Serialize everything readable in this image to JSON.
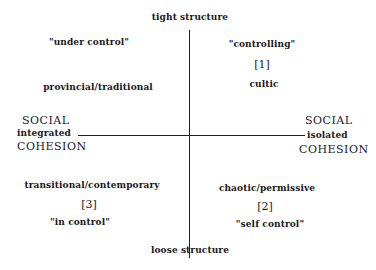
{
  "diagram": {
    "vertical_axis": {
      "top_label": "tight structure",
      "bottom_label": "loose structure"
    },
    "horizontal_axis": {
      "left": {
        "line1": "SOCIAL",
        "line2": "integrated",
        "line3": "COHESION"
      },
      "right": {
        "line1": "SOCIAL",
        "line2": "isolated",
        "line3": "COHESION"
      }
    },
    "quadrants": {
      "top_left": {
        "quote": "\"under control\"",
        "label": "provincial/traditional"
      },
      "top_right": {
        "quote": "\"controlling\"",
        "number": "[1]",
        "label": "cultic"
      },
      "bottom_left": {
        "label": "transitional/contemporary",
        "number": "[3]",
        "quote": "\"in control\""
      },
      "bottom_right": {
        "label": "chaotic/permissive",
        "number": "[2]",
        "quote": "\"self control\""
      }
    }
  }
}
